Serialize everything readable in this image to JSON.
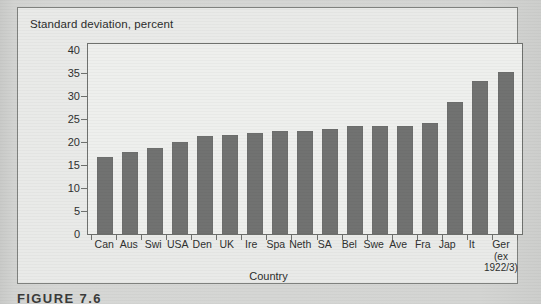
{
  "figure": {
    "caption": "FIGURE 7.6",
    "axis_title_y": "Standard deviation, percent",
    "axis_title_x": "Country"
  },
  "chart_data": {
    "type": "bar",
    "title": "Standard deviation, percent",
    "xlabel": "Country",
    "ylabel": "Standard deviation, percent",
    "ylim": [
      0,
      40
    ],
    "yticks": [
      0,
      5,
      10,
      15,
      20,
      25,
      30,
      35,
      40
    ],
    "grid": false,
    "legend": false,
    "bar_color": "#717271",
    "categories": [
      "Can",
      "Aus",
      "Swi",
      "USA",
      "Den",
      "UK",
      "Ire",
      "Spa",
      "Neth",
      "SA",
      "Bel",
      "Swe",
      "Ave",
      "Fra",
      "Jap",
      "It",
      "Ger"
    ],
    "category_sublabels": [
      "",
      "",
      "",
      "",
      "",
      "",
      "",
      "",
      "",
      "",
      "",
      "",
      "",
      "",
      "",
      "",
      "(ex 1922/3)"
    ],
    "category_sublabel_lines": [
      [],
      [],
      [],
      [],
      [],
      [],
      [],
      [],
      [],
      [],
      [],
      [],
      [],
      [],
      [],
      [],
      [
        "(ex",
        "1922/3)"
      ]
    ],
    "values": [
      16.7,
      17.9,
      18.8,
      19.9,
      21.3,
      21.5,
      22.0,
      22.3,
      22.4,
      22.8,
      23.4,
      23.4,
      23.4,
      24.2,
      28.8,
      33.3,
      35.3
    ]
  }
}
